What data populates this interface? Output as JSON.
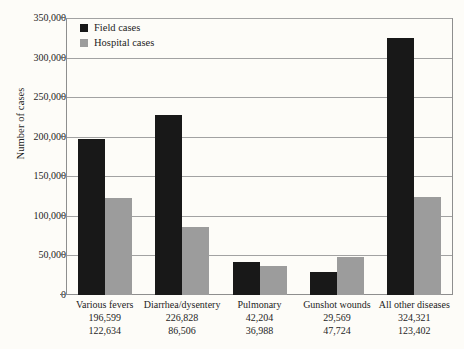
{
  "chart_data": {
    "type": "bar",
    "title": "",
    "subtitle": "",
    "xlabel": "",
    "ylabel": "Number of cases",
    "ylim": [
      0,
      350000
    ],
    "ytick_labels": [
      "0",
      "50,000",
      "100,000",
      "150,000",
      "200,000",
      "250,000",
      "300,000",
      "350,000"
    ],
    "ytick_values": [
      0,
      50000,
      100000,
      150000,
      200000,
      250000,
      300000,
      350000
    ],
    "grid": true,
    "legend_position": "top-left-inside",
    "categories": [
      "Various fevers",
      "Diarrhea/dysentery",
      "Pulmonary",
      "Gunshot wounds",
      "All other diseases"
    ],
    "series": [
      {
        "name": "Field cases",
        "color": "#181818",
        "values": [
          196599,
          226828,
          42204,
          29569,
          324321
        ],
        "value_labels": [
          "196,599",
          "226,828",
          "42,204",
          "29,569",
          "324,321"
        ]
      },
      {
        "name": "Hospital cases",
        "color": "#9c9c9c",
        "values": [
          122634,
          86506,
          36988,
          47724,
          123402
        ],
        "value_labels": [
          "122,634",
          "86,506",
          "36,988",
          "47,724",
          "123,402"
        ]
      }
    ]
  },
  "legend": {
    "items": [
      {
        "label": "Field cases",
        "swatch": "legend-swatch-field"
      },
      {
        "label": "Hospital cases",
        "swatch": "legend-swatch-hospital"
      }
    ]
  }
}
